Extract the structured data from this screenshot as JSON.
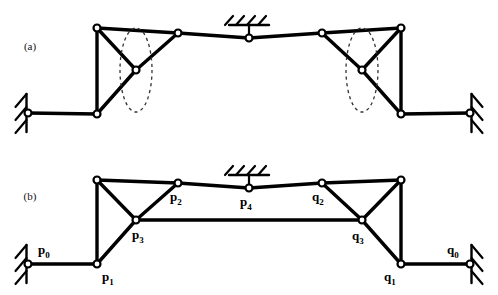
{
  "figure": {
    "background_color": "#ffffff",
    "line_color": "#000000",
    "node_fill_color": "#ffffff",
    "dashed_path_color": "#333333",
    "width": 498,
    "height": 295
  },
  "panels": [
    {
      "id": "a",
      "tag": "(a)",
      "tag_x": 30,
      "tag_y": 50,
      "description": "unlabeled linkage with dashed coupler curves"
    },
    {
      "id": "b",
      "tag": "(b)",
      "tag_x": 30,
      "tag_y": 200,
      "description": "labeled linkage with coupler bar p3-q3"
    }
  ],
  "panel_a": {
    "joints": [
      {
        "name": "ground-left-pivot",
        "x": 28,
        "y": 113
      },
      {
        "name": "lower-left-joint",
        "x": 97,
        "y": 114
      },
      {
        "name": "upper-left-joint",
        "x": 97,
        "y": 28
      },
      {
        "name": "coupler-left-joint",
        "x": 136,
        "y": 70
      },
      {
        "name": "left-top-joint",
        "x": 178,
        "y": 33
      },
      {
        "name": "center-ground-joint",
        "x": 249,
        "y": 38
      },
      {
        "name": "right-top-joint",
        "x": 322,
        "y": 33
      },
      {
        "name": "coupler-right-joint",
        "x": 362,
        "y": 70
      },
      {
        "name": "upper-right-joint",
        "x": 401,
        "y": 28
      },
      {
        "name": "lower-right-joint",
        "x": 401,
        "y": 114
      },
      {
        "name": "ground-right-pivot",
        "x": 470,
        "y": 113
      }
    ],
    "links": [
      {
        "from": [
          28,
          113
        ],
        "to": [
          97,
          114
        ],
        "name": "link-ground-left"
      },
      {
        "from": [
          97,
          114
        ],
        "to": [
          97,
          28
        ],
        "name": "link-left-vertical"
      },
      {
        "from": [
          97,
          28
        ],
        "to": [
          136,
          70
        ],
        "name": "link-left-upper-diagonal"
      },
      {
        "from": [
          97,
          114
        ],
        "to": [
          136,
          70
        ],
        "name": "link-left-lower-diagonal"
      },
      {
        "from": [
          136,
          70
        ],
        "to": [
          178,
          33
        ],
        "name": "link-left-coupler-diagonal"
      },
      {
        "from": [
          97,
          28
        ],
        "to": [
          178,
          33
        ],
        "name": "link-left-top-bar"
      },
      {
        "from": [
          178,
          33
        ],
        "to": [
          249,
          38
        ],
        "name": "link-center-left-bar"
      },
      {
        "from": [
          249,
          38
        ],
        "to": [
          322,
          33
        ],
        "name": "link-center-right-bar"
      },
      {
        "from": [
          322,
          33
        ],
        "to": [
          401,
          28
        ],
        "name": "link-right-top-bar"
      },
      {
        "from": [
          322,
          33
        ],
        "to": [
          362,
          70
        ],
        "name": "link-right-coupler-diagonal"
      },
      {
        "from": [
          401,
          28
        ],
        "to": [
          362,
          70
        ],
        "name": "link-right-upper-diagonal"
      },
      {
        "from": [
          401,
          114
        ],
        "to": [
          362,
          70
        ],
        "name": "link-right-lower-diagonal"
      },
      {
        "from": [
          401,
          28
        ],
        "to": [
          401,
          114
        ],
        "name": "link-right-vertical"
      },
      {
        "from": [
          401,
          114
        ],
        "to": [
          470,
          113
        ],
        "name": "link-ground-right"
      }
    ],
    "dashed_curves": [
      {
        "name": "coupler-curve-left",
        "cx": 136,
        "cy": 70,
        "rx": 16,
        "ry": 42
      },
      {
        "name": "coupler-curve-right",
        "cx": 362,
        "cy": 70,
        "rx": 16,
        "ry": 42
      }
    ],
    "supports": [
      {
        "name": "support-ground-left",
        "type": "vertical-hatch-left",
        "x": 28,
        "y": 113
      },
      {
        "name": "support-ground-center",
        "type": "horizontal-hatch-top",
        "x": 249,
        "y": 38
      },
      {
        "name": "support-ground-right",
        "type": "vertical-hatch-right",
        "x": 470,
        "y": 113
      }
    ]
  },
  "panel_b": {
    "joints": [
      {
        "label": "p0",
        "base": "p",
        "sub": "0",
        "x": 28,
        "y": 264,
        "lx": 38,
        "ly": 254,
        "anchor": "start"
      },
      {
        "label": "p1",
        "base": "p",
        "sub": "1",
        "x": 97,
        "y": 264,
        "lx": 102,
        "ly": 281,
        "anchor": "start"
      },
      {
        "label": "",
        "base": "",
        "sub": "",
        "x": 97,
        "y": 180,
        "lx": 0,
        "ly": 0,
        "anchor": "start"
      },
      {
        "label": "p3",
        "base": "p",
        "sub": "3",
        "x": 136,
        "y": 220,
        "lx": 132,
        "ly": 239,
        "anchor": "start"
      },
      {
        "label": "p2",
        "base": "p",
        "sub": "2",
        "x": 178,
        "y": 183,
        "lx": 170,
        "ly": 201,
        "anchor": "start"
      },
      {
        "label": "p4",
        "base": "p",
        "sub": "4",
        "x": 249,
        "y": 188,
        "lx": 240,
        "ly": 206,
        "anchor": "start"
      },
      {
        "label": "q2",
        "base": "q",
        "sub": "2",
        "x": 322,
        "y": 183,
        "lx": 312,
        "ly": 201,
        "anchor": "start"
      },
      {
        "label": "q3",
        "base": "q",
        "sub": "3",
        "x": 362,
        "y": 220,
        "lx": 352,
        "ly": 240,
        "anchor": "start"
      },
      {
        "label": "",
        "base": "",
        "sub": "",
        "x": 401,
        "y": 180,
        "lx": 0,
        "ly": 0,
        "anchor": "start"
      },
      {
        "label": "q1",
        "base": "q",
        "sub": "1",
        "x": 401,
        "y": 264,
        "lx": 384,
        "ly": 281,
        "anchor": "start"
      },
      {
        "label": "q0",
        "base": "q",
        "sub": "0",
        "x": 470,
        "y": 264,
        "lx": 447,
        "ly": 254,
        "anchor": "start"
      }
    ],
    "links": [
      {
        "from": [
          28,
          264
        ],
        "to": [
          97,
          264
        ],
        "name": "link-p0-p1"
      },
      {
        "from": [
          97,
          264
        ],
        "to": [
          97,
          180
        ],
        "name": "link-p1-upper-left"
      },
      {
        "from": [
          97,
          180
        ],
        "to": [
          136,
          220
        ],
        "name": "link-upperleft-p3"
      },
      {
        "from": [
          97,
          264
        ],
        "to": [
          136,
          220
        ],
        "name": "link-p1-p3"
      },
      {
        "from": [
          136,
          220
        ],
        "to": [
          178,
          183
        ],
        "name": "link-p3-p2"
      },
      {
        "from": [
          97,
          180
        ],
        "to": [
          178,
          183
        ],
        "name": "link-upperleft-p2"
      },
      {
        "from": [
          178,
          183
        ],
        "to": [
          249,
          188
        ],
        "name": "link-p2-p4"
      },
      {
        "from": [
          249,
          188
        ],
        "to": [
          322,
          183
        ],
        "name": "link-p4-q2"
      },
      {
        "from": [
          322,
          183
        ],
        "to": [
          401,
          180
        ],
        "name": "link-q2-upperright"
      },
      {
        "from": [
          322,
          183
        ],
        "to": [
          362,
          220
        ],
        "name": "link-q2-q3"
      },
      {
        "from": [
          401,
          180
        ],
        "to": [
          362,
          220
        ],
        "name": "link-upperright-q3"
      },
      {
        "from": [
          401,
          264
        ],
        "to": [
          362,
          220
        ],
        "name": "link-q1-q3"
      },
      {
        "from": [
          401,
          180
        ],
        "to": [
          401,
          264
        ],
        "name": "link-upperright-q1"
      },
      {
        "from": [
          401,
          264
        ],
        "to": [
          470,
          264
        ],
        "name": "link-q1-q0"
      },
      {
        "from": [
          136,
          220
        ],
        "to": [
          362,
          220
        ],
        "name": "link-p3-q3-coupler"
      }
    ],
    "supports": [
      {
        "name": "support-ground-p0",
        "type": "vertical-hatch-left",
        "x": 28,
        "y": 264
      },
      {
        "name": "support-ground-p4",
        "type": "horizontal-hatch-top",
        "x": 249,
        "y": 188
      },
      {
        "name": "support-ground-q0",
        "type": "vertical-hatch-right",
        "x": 470,
        "y": 264
      }
    ]
  }
}
